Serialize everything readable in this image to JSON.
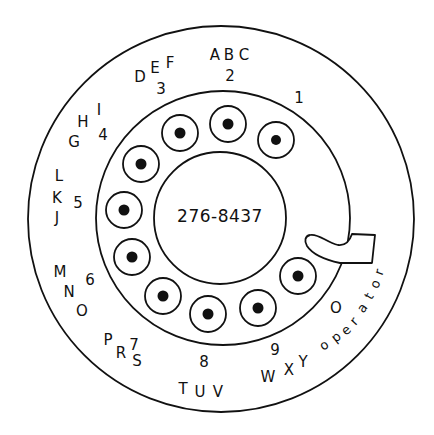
{
  "center_label": "276-8437",
  "colors": {
    "ink": "#111111",
    "background": "#ffffff"
  },
  "finger_stop": {
    "icon": "finger-stop-icon"
  },
  "holes": [
    {
      "digit": "1",
      "cx": 276,
      "cy": 140
    },
    {
      "digit": "2",
      "cx": 228,
      "cy": 124
    },
    {
      "digit": "3",
      "cx": 180,
      "cy": 133
    },
    {
      "digit": "4",
      "cx": 141,
      "cy": 164
    },
    {
      "digit": "5",
      "cx": 124,
      "cy": 210
    },
    {
      "digit": "6",
      "cx": 132,
      "cy": 257
    },
    {
      "digit": "7",
      "cx": 163,
      "cy": 296
    },
    {
      "digit": "8",
      "cx": 208,
      "cy": 314
    },
    {
      "digit": "9",
      "cx": 258,
      "cy": 308
    },
    {
      "digit": "0",
      "cx": 298,
      "cy": 276
    }
  ],
  "digit_labels": [
    {
      "digit": "1",
      "letters": ""
    },
    {
      "digit": "2",
      "letters": "ABC"
    },
    {
      "digit": "3",
      "letters": "DEF"
    },
    {
      "digit": "4",
      "letters": "GHI"
    },
    {
      "digit": "5",
      "letters": "JKL"
    },
    {
      "digit": "6",
      "letters": "MNO"
    },
    {
      "digit": "7",
      "letters": "PRS"
    },
    {
      "digit": "8",
      "letters": "TUV"
    },
    {
      "digit": "9",
      "letters": "WXY"
    },
    {
      "digit": "0",
      "letters": "operator"
    }
  ],
  "glyphs": {
    "d1": "1",
    "d2": "2",
    "a": "A",
    "b": "B",
    "c": "C",
    "d3": "3",
    "d": "D",
    "e": "E",
    "f": "F",
    "d4": "4",
    "g": "G",
    "h": "H",
    "i": "I",
    "d5": "5",
    "j": "J",
    "k": "K",
    "l": "L",
    "d6": "6",
    "m": "M",
    "n": "N",
    "o": "O",
    "d7": "7",
    "p": "P",
    "r": "R",
    "s": "S",
    "d8": "8",
    "t": "T",
    "u": "U",
    "v": "V",
    "d9": "9",
    "w": "W",
    "x": "X",
    "y": "Y",
    "d0": "O",
    "operator": [
      "o",
      "p",
      "e",
      "r",
      "a",
      "t",
      "o",
      "r"
    ]
  }
}
